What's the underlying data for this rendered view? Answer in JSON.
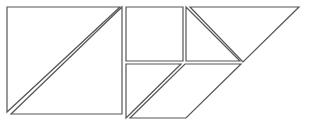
{
  "diagram": {
    "type": "tangram",
    "stroke_color": "#555555",
    "fill_color": "#ffffff",
    "pieces": [
      {
        "name": "large-square-lower-triangle",
        "points": "7,9 7,116 118,116"
      },
      {
        "name": "large-square-upper-triangle",
        "points": "11,114 122,7 122,114"
      },
      {
        "name": "large-square-top-left-triangle",
        "points": "7,7 120,7 7,112"
      },
      {
        "name": "small-square",
        "points": "126,7 183,7 183,61 126,61"
      },
      {
        "name": "medium-right-triangle",
        "points": "186,7 186,61 240,61"
      },
      {
        "name": "large-top-triangle",
        "points": "190,7 299,7 243,62"
      },
      {
        "name": "lower-left-triangle",
        "points": "126,64 181,64 126,118"
      },
      {
        "name": "parallelogram",
        "points": "185,64 241,64 186,118 130,118"
      }
    ]
  }
}
